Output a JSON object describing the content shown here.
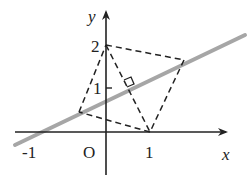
{
  "diagram": {
    "axes": {
      "x_label": "x",
      "y_label": "y",
      "origin_label": "O",
      "x_ticks": [
        "-1",
        "1"
      ],
      "y_ticks": [
        "1",
        "2"
      ]
    },
    "points": {
      "A": {
        "coord": [
          0,
          2
        ],
        "desc": "on y-axis"
      },
      "B": {
        "coord": [
          1,
          0
        ],
        "desc": "on x-axis"
      },
      "C": {
        "desc": "left vertex on gray line, reflection-related"
      },
      "D": {
        "desc": "right vertex on gray line"
      }
    },
    "line": {
      "desc": "gray line through (-1,0)",
      "color": "#a6a6a6"
    },
    "features": [
      "dashed quadrilateral",
      "right-angle marker where segment A-B meets line"
    ],
    "colors": {
      "axis": "#222222",
      "dashed": "#222222",
      "line": "#a6a6a6"
    }
  }
}
